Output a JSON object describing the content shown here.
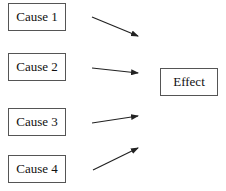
{
  "diagram": {
    "type": "cause-effect",
    "causes": [
      {
        "label": "Cause 1"
      },
      {
        "label": "Cause 2"
      },
      {
        "label": "Cause 3"
      },
      {
        "label": "Cause 4"
      }
    ],
    "effect": {
      "label": "Effect"
    },
    "colors": {
      "line": "#222222",
      "border": "#555555",
      "background": "#ffffff"
    }
  }
}
